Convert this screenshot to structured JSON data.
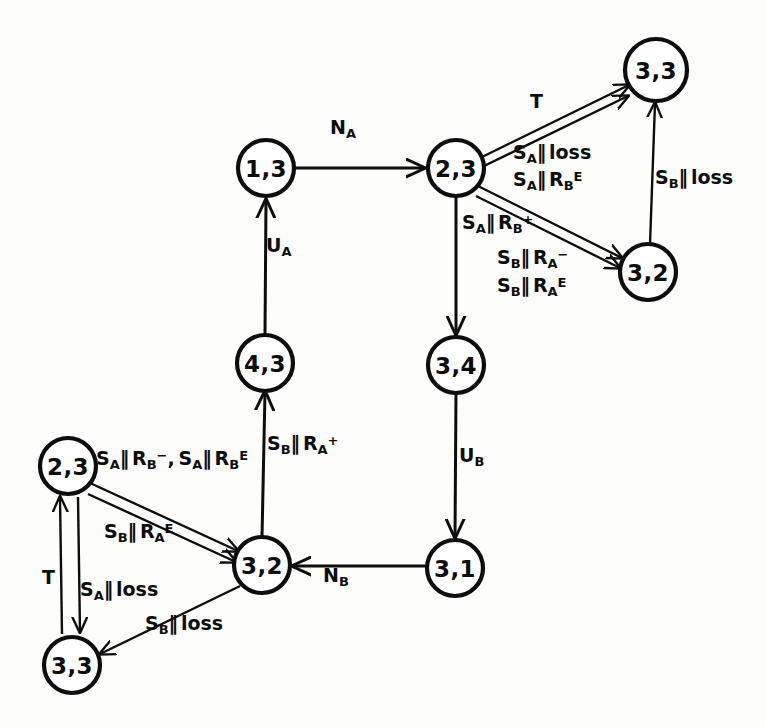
{
  "figure": {
    "type": "state-transition-diagram",
    "background_color": "#fdfdfb",
    "ink_color": "#0d0d0d"
  },
  "nodes": [
    {
      "id": "n_13",
      "label": "1,3",
      "cx": 266,
      "cy": 168,
      "r": 28
    },
    {
      "id": "n_23_top",
      "label": "2,3",
      "cx": 456,
      "cy": 168,
      "r": 28
    },
    {
      "id": "n_33_top",
      "label": "3,3",
      "cx": 656,
      "cy": 70,
      "r": 31
    },
    {
      "id": "n_32_top",
      "label": "3,2",
      "cx": 648,
      "cy": 272,
      "r": 28
    },
    {
      "id": "n_43",
      "label": "4,3",
      "cx": 265,
      "cy": 363,
      "r": 28
    },
    {
      "id": "n_34",
      "label": "3,4",
      "cx": 456,
      "cy": 365,
      "r": 28
    },
    {
      "id": "n_31",
      "label": "3,1",
      "cx": 455,
      "cy": 568,
      "r": 28
    },
    {
      "id": "n_32_bot",
      "label": "3,2",
      "cx": 262,
      "cy": 565,
      "r": 28
    },
    {
      "id": "n_23_bot",
      "label": "2,3",
      "cx": 68,
      "cy": 466,
      "r": 28
    },
    {
      "id": "n_33_bot",
      "label": "3,3",
      "cx": 72,
      "cy": 665,
      "r": 28
    }
  ],
  "edge_labels": [
    {
      "id": "lbl_na",
      "text": "N_A",
      "base": "N",
      "sub": "A",
      "sup": "",
      "x": 340,
      "y": 128
    },
    {
      "id": "lbl_ua",
      "text": "U_A",
      "base": "U",
      "sub": "A",
      "sup": "",
      "x": 274,
      "y": 245
    },
    {
      "id": "lbl_ub",
      "text": "U_B",
      "base": "U",
      "sub": "B",
      "sup": "",
      "x": 466,
      "y": 455
    },
    {
      "id": "lbl_nb",
      "text": "N_B",
      "base": "N",
      "sub": "B",
      "sup": "",
      "x": 330,
      "y": 575
    },
    {
      "id": "lbl_t_top",
      "text": "T",
      "base": "T",
      "sub": "",
      "sup": "",
      "x": 535,
      "y": 100
    },
    {
      "id": "lbl_t_bot",
      "text": "T",
      "base": "T",
      "sub": "",
      "sup": "",
      "x": 47,
      "y": 576
    },
    {
      "id": "lbl_sa_loss_1",
      "text": "S_A ‖ loss",
      "x": 524,
      "y": 153
    },
    {
      "id": "lbl_sa_rbe_1",
      "text": "S_A ‖ R_B^E",
      "x": 524,
      "y": 178
    },
    {
      "id": "lbl_sb_loss_r",
      "text": "S_B ‖ loss",
      "x": 664,
      "y": 176
    },
    {
      "id": "lbl_sa_rbp",
      "text": "S_A ‖ R_B^+",
      "x": 470,
      "y": 222
    },
    {
      "id": "lbl_sb_ram",
      "text": "S_B ‖ R_A^-",
      "x": 505,
      "y": 257
    },
    {
      "id": "lbl_sb_rae",
      "text": "S_B ‖ R_A^E",
      "x": 505,
      "y": 284
    },
    {
      "id": "lbl_sb_rap",
      "text": "S_B ‖ R_A^+",
      "x": 275,
      "y": 443
    },
    {
      "id": "lbl_sa_pair",
      "text": "S_A ‖ R_B^- , S_A ‖ R_B^E",
      "x": 103,
      "y": 457
    },
    {
      "id": "lbl_sb_rae_b",
      "text": "S_B ‖ R_A^E",
      "x": 112,
      "y": 531
    },
    {
      "id": "lbl_sa_loss_b",
      "text": "S_A ‖ loss",
      "x": 88,
      "y": 588
    },
    {
      "id": "lbl_sb_loss_b",
      "text": "S_B ‖ loss",
      "x": 152,
      "y": 622
    }
  ],
  "transitions": [
    {
      "from": "1,3",
      "to": "2,3",
      "label": "N_A"
    },
    {
      "from": "4,3",
      "to": "1,3",
      "label": "U_A"
    },
    {
      "from": "2,3",
      "to": "3,3",
      "label": "T"
    },
    {
      "from": "3,3",
      "to": "2,3",
      "label": "S_A ‖ loss"
    },
    {
      "from": "3,3",
      "to": "2,3",
      "label": "S_A ‖ R_B^E"
    },
    {
      "from": "3,2",
      "to": "3,3",
      "label": "S_B ‖ loss"
    },
    {
      "from": "2,3",
      "to": "3,2",
      "label": "S_A ‖ R_B^+"
    },
    {
      "from": "3,2",
      "to": "2,3",
      "label": "S_B ‖ R_A^-"
    },
    {
      "from": "3,2",
      "to": "2,3",
      "label": "S_B ‖ R_A^E"
    },
    {
      "from": "2,3",
      "to": "3,4",
      "label": ""
    },
    {
      "from": "3,4",
      "to": "3,1",
      "label": "U_B"
    },
    {
      "from": "3,1",
      "to": "3,2",
      "label": "N_B"
    },
    {
      "from": "3,2",
      "to": "4,3",
      "label": "S_B ‖ R_A^+"
    },
    {
      "from": "2,3",
      "to": "3,2",
      "label": "S_A ‖ R_B^- , S_A ‖ R_B^E"
    },
    {
      "from": "3,2",
      "to": "2,3",
      "label": "S_B ‖ R_A^E"
    },
    {
      "from": "2,3",
      "to": "3,3",
      "label": "S_A ‖ loss"
    },
    {
      "from": "3,3",
      "to": "2,3",
      "label": "T"
    },
    {
      "from": "3,2",
      "to": "3,3",
      "label": "S_B ‖ loss"
    }
  ]
}
